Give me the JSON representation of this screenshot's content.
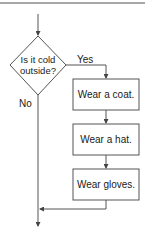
{
  "diagram": {
    "decision": {
      "line1": "Is it cold",
      "line2": "outside?"
    },
    "branches": {
      "yes_label": "Yes",
      "no_label": "No"
    },
    "steps": [
      {
        "label": "Wear a coat."
      },
      {
        "label": "Wear a hat."
      },
      {
        "label": "Wear gloves."
      }
    ],
    "colors": {
      "stroke": "#555555",
      "top_rule": "#8a8a8a",
      "text": "#1a1a1a"
    }
  }
}
